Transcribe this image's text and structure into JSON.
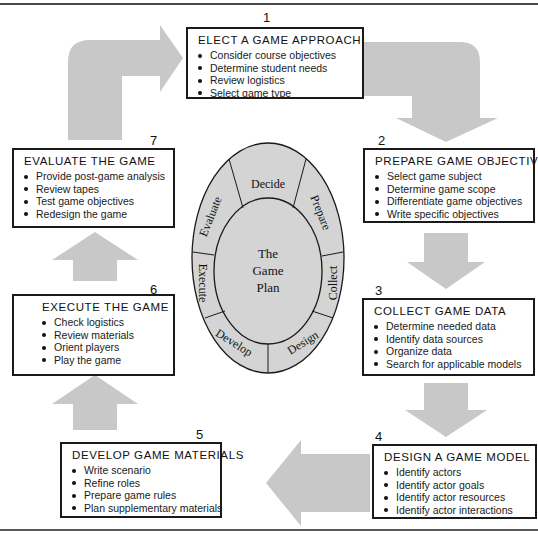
{
  "colors": {
    "arrow_fill": "#c8c8c8",
    "oval_fill": "#d4d4d4",
    "stroke": "#1a1a1a"
  },
  "cycle": {
    "center_label": [
      "The",
      "Game",
      "Plan"
    ],
    "segments": [
      "Decide",
      "Prepare",
      "Collect",
      "Design",
      "Develop",
      "Execute",
      "Evaluate"
    ]
  },
  "steps": [
    {
      "number": "1",
      "title": "ELECT A GAME APPROACH",
      "items": [
        "Consider course objectives",
        "Determine student needs",
        "Review logistics",
        "Select game type"
      ]
    },
    {
      "number": "2",
      "title": "PREPARE GAME OBJECTIVES",
      "items": [
        "Select game subject",
        "Determine game scope",
        "Differentiate game objectives",
        "Write specific objectives"
      ]
    },
    {
      "number": "3",
      "title": "COLLECT GAME DATA",
      "items": [
        "Determine needed data",
        "Identify data sources",
        "Organize data",
        "Search for applicable models"
      ]
    },
    {
      "number": "4",
      "title": "DESIGN A GAME MODEL",
      "items": [
        "Identify actors",
        "Identify actor goals",
        "Identify actor resources",
        "Identify actor interactions"
      ]
    },
    {
      "number": "5",
      "title": "DEVELOP GAME MATERIALS",
      "items": [
        "Write scenario",
        "Refine roles",
        "Prepare game rules",
        "Plan supplementary materials"
      ]
    },
    {
      "number": "6",
      "title": "EXECUTE THE GAME",
      "items": [
        "Check logistics",
        "Review materials",
        "Orient players",
        "Play the game"
      ]
    },
    {
      "number": "7",
      "title": "EVALUATE THE GAME",
      "items": [
        "Provide post-game analysis",
        "Review tapes",
        "Test game objectives",
        "Redesign the game"
      ]
    }
  ]
}
